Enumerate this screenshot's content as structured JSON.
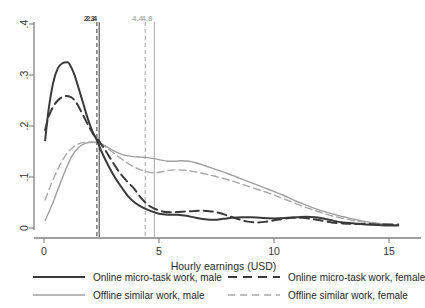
{
  "chart_data": {
    "type": "line",
    "title": "",
    "xlabel": "Hourly earnings (USD)",
    "ylabel": "",
    "xlim": [
      0,
      15.6
    ],
    "ylim": [
      0,
      0.4
    ],
    "xticks": [
      0,
      5,
      10,
      15
    ],
    "xtick_labels": [
      "0",
      "5",
      "10",
      "15"
    ],
    "yticks": [
      0,
      0.1,
      0.2,
      0.3,
      0.4
    ],
    "ytick_labels": [
      "0",
      ".1",
      ".2",
      ".3",
      ".4"
    ],
    "grid": false,
    "legend_position": "bottom",
    "colors": {
      "online_male": "#3a3a3a",
      "online_female": "#3a3a3a",
      "offline_male": "#a0a0a0",
      "offline_female": "#a8a8a8",
      "axis": "#808080",
      "text": "#2b2b2b"
    },
    "reference_lines": [
      {
        "name": "online-female-median",
        "value": 2.3,
        "label": "2.3",
        "style": "dashed",
        "color": "#4a4a4a"
      },
      {
        "name": "online-male-median",
        "value": 2.4,
        "label": "2.4",
        "style": "solid",
        "color": "#4a4a4a"
      },
      {
        "name": "offline-female-median",
        "value": 4.4,
        "label": "4.4",
        "style": "dashed",
        "color": "#b0b0b0"
      },
      {
        "name": "offline-male-median",
        "value": 4.8,
        "label": "4.8",
        "style": "solid",
        "color": "#b0b0b0"
      }
    ],
    "series": [
      {
        "name": "Online micro-task work, male",
        "key": "online_male",
        "style": "solid",
        "color": "#3a3a3a",
        "width": 2.0,
        "x": [
          0.05,
          0.2,
          0.4,
          0.6,
          0.8,
          1.0,
          1.1,
          1.3,
          1.5,
          1.7,
          1.9,
          2.1,
          2.3,
          2.5,
          2.8,
          3.1,
          3.4,
          3.7,
          4.0,
          4.3,
          4.6,
          5.0,
          5.4,
          5.8,
          6.2,
          6.6,
          7.0,
          7.4,
          7.8,
          8.2,
          8.6,
          9.0,
          9.4,
          9.8,
          10.2,
          10.6,
          11.0,
          11.4,
          11.8,
          12.2,
          12.6,
          13.0,
          13.5,
          14.0,
          14.5,
          15.0,
          15.4
        ],
        "y": [
          0.172,
          0.232,
          0.285,
          0.313,
          0.323,
          0.325,
          0.322,
          0.303,
          0.275,
          0.245,
          0.215,
          0.19,
          0.172,
          0.15,
          0.122,
          0.098,
          0.078,
          0.06,
          0.048,
          0.04,
          0.034,
          0.028,
          0.026,
          0.026,
          0.024,
          0.02,
          0.017,
          0.016,
          0.018,
          0.02,
          0.021,
          0.021,
          0.02,
          0.019,
          0.019,
          0.02,
          0.021,
          0.022,
          0.021,
          0.018,
          0.014,
          0.011,
          0.009,
          0.007,
          0.006,
          0.005,
          0.005
        ]
      },
      {
        "name": "Online micro-task work, female",
        "key": "online_female",
        "style": "dashed",
        "color": "#3a3a3a",
        "width": 2.0,
        "x": [
          0.05,
          0.2,
          0.4,
          0.6,
          0.8,
          1.0,
          1.2,
          1.4,
          1.6,
          1.8,
          2.0,
          2.2,
          2.4,
          2.7,
          3.0,
          3.3,
          3.6,
          3.9,
          4.2,
          4.5,
          4.8,
          5.2,
          5.6,
          6.0,
          6.4,
          6.8,
          7.2,
          7.6,
          8.0,
          8.4,
          8.8,
          9.2,
          9.6,
          10.0,
          10.4,
          10.8,
          11.2,
          11.6,
          12.0,
          12.5,
          13.0,
          13.5,
          14.0,
          14.5,
          15.0,
          15.4
        ],
        "y": [
          0.192,
          0.218,
          0.238,
          0.25,
          0.257,
          0.259,
          0.256,
          0.246,
          0.23,
          0.212,
          0.195,
          0.18,
          0.17,
          0.15,
          0.128,
          0.108,
          0.092,
          0.078,
          0.06,
          0.046,
          0.038,
          0.032,
          0.031,
          0.032,
          0.033,
          0.034,
          0.033,
          0.03,
          0.024,
          0.018,
          0.013,
          0.011,
          0.012,
          0.015,
          0.018,
          0.02,
          0.02,
          0.018,
          0.015,
          0.011,
          0.009,
          0.008,
          0.008,
          0.007,
          0.007,
          0.007
        ]
      },
      {
        "name": "Offline similar work, male",
        "key": "offline_male",
        "style": "solid",
        "color": "#a0a0a0",
        "width": 1.4,
        "x": [
          0.05,
          0.3,
          0.6,
          0.9,
          1.2,
          1.5,
          1.8,
          2.1,
          2.4,
          2.7,
          3.0,
          3.3,
          3.6,
          3.9,
          4.2,
          4.5,
          4.8,
          5.1,
          5.4,
          5.7,
          6.0,
          6.3,
          6.6,
          7.0,
          7.4,
          7.8,
          8.2,
          8.6,
          9.0,
          9.4,
          9.8,
          10.2,
          10.6,
          11.0,
          11.4,
          11.8,
          12.2,
          12.6,
          13.0,
          13.4,
          13.8,
          14.2,
          14.6,
          15.0,
          15.4
        ],
        "y": [
          0.015,
          0.04,
          0.075,
          0.11,
          0.14,
          0.158,
          0.166,
          0.168,
          0.167,
          0.16,
          0.152,
          0.146,
          0.142,
          0.14,
          0.139,
          0.138,
          0.136,
          0.133,
          0.131,
          0.131,
          0.132,
          0.131,
          0.128,
          0.122,
          0.116,
          0.11,
          0.103,
          0.096,
          0.089,
          0.082,
          0.075,
          0.068,
          0.06,
          0.052,
          0.045,
          0.038,
          0.032,
          0.027,
          0.022,
          0.018,
          0.014,
          0.011,
          0.009,
          0.007,
          0.006
        ]
      },
      {
        "name": "Offline similar work, female",
        "key": "offline_female",
        "style": "dashed",
        "color": "#a8a8a8",
        "width": 1.4,
        "x": [
          0.05,
          0.3,
          0.6,
          0.9,
          1.2,
          1.5,
          1.8,
          2.1,
          2.4,
          2.7,
          3.0,
          3.3,
          3.6,
          3.9,
          4.2,
          4.5,
          4.8,
          5.1,
          5.4,
          5.8,
          6.2,
          6.6,
          7.0,
          7.4,
          7.8,
          8.2,
          8.6,
          9.0,
          9.4,
          9.8,
          10.2,
          10.6,
          11.0,
          11.4,
          11.8,
          12.2,
          12.6,
          13.0,
          13.4,
          13.8,
          14.2,
          14.6,
          15.0,
          15.4
        ],
        "y": [
          0.055,
          0.085,
          0.115,
          0.14,
          0.156,
          0.165,
          0.168,
          0.168,
          0.166,
          0.158,
          0.148,
          0.138,
          0.128,
          0.12,
          0.114,
          0.11,
          0.108,
          0.11,
          0.113,
          0.114,
          0.113,
          0.11,
          0.106,
          0.102,
          0.097,
          0.092,
          0.086,
          0.08,
          0.074,
          0.068,
          0.061,
          0.054,
          0.047,
          0.04,
          0.034,
          0.028,
          0.023,
          0.019,
          0.015,
          0.012,
          0.01,
          0.008,
          0.007,
          0.006
        ]
      }
    ]
  },
  "axes": {
    "x_title": "Hourly earnings (USD)",
    "x_tick_labels": [
      "0",
      "5",
      "10",
      "15"
    ],
    "y_tick_labels": [
      "0",
      ".1",
      ".2",
      ".3",
      ".4"
    ]
  },
  "vline_labels": {
    "l1": "2.3",
    "l2": "2.4",
    "l3": "4.4",
    "l4": "4.8"
  },
  "legend": {
    "items": [
      {
        "label": "Online micro-task work, male",
        "style": "solid",
        "color": "#3a3a3a",
        "width": 2.0
      },
      {
        "label": "Online micro-task work, female",
        "style": "dashed",
        "color": "#3a3a3a",
        "width": 2.0
      },
      {
        "label": "Offline similar work, male",
        "style": "solid",
        "color": "#a0a0a0",
        "width": 1.4
      },
      {
        "label": "Offline similar work, female",
        "style": "dashed",
        "color": "#a8a8a8",
        "width": 1.4
      }
    ]
  }
}
